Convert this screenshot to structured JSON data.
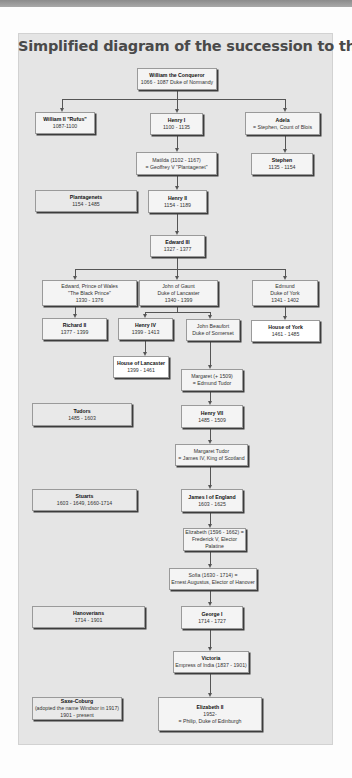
{
  "title": "Simplified diagram of the succession to the Throne",
  "nodes": {
    "william_conqueror": {
      "name": "William the Conqueror",
      "lines": [
        "1066 - 1087 Duke of Normandy"
      ]
    },
    "william_ii": {
      "name": "William II \"Rufus\"",
      "lines": [
        "1087-1100"
      ]
    },
    "henry_i": {
      "name": "Henry I",
      "lines": [
        "1100 - 1135"
      ]
    },
    "adela": {
      "name": "Adela",
      "lines": [
        "= Stephen, Count of Blois"
      ]
    },
    "matilda": {
      "name": "",
      "lines": [
        "Matilda  (1102 - 1167)",
        "= Geoffrey V \"Plantagenet\""
      ]
    },
    "stephen": {
      "name": "Stephen",
      "lines": [
        "1135 - 1154"
      ]
    },
    "plantagenets": {
      "name": "Plantagenets",
      "lines": [
        "1154 - 1485"
      ]
    },
    "henry_ii": {
      "name": "Henry II",
      "lines": [
        "1154 - 1189"
      ]
    },
    "edward_iii": {
      "name": "Edward III",
      "lines": [
        "1327 - 1377"
      ]
    },
    "black_prince": {
      "name": "",
      "lines": [
        "Edward, Prince of Wales",
        "\"The Black Prince\"",
        "1330 - 1376"
      ]
    },
    "john_of_gaunt": {
      "name": "",
      "lines": [
        "John of Gaunt",
        "Duke of Lancaster",
        "1340 - 1399"
      ]
    },
    "edmund": {
      "name": "",
      "lines": [
        "Edmund",
        "Duke of York",
        "1341 - 1402"
      ]
    },
    "richard_ii": {
      "name": "Richard II",
      "lines": [
        "1377 - 1399"
      ]
    },
    "henry_iv": {
      "name": "Henry IV",
      "lines": [
        "1399 - 1413"
      ]
    },
    "john_beaufort": {
      "name": "",
      "lines": [
        "John Beaufort",
        "Duke of Somerset"
      ]
    },
    "house_of_york": {
      "name": "House of York",
      "lines": [
        "1461 - 1485"
      ]
    },
    "house_of_lancaster": {
      "name": "House of Lancaster",
      "lines": [
        "1399 - 1461"
      ]
    },
    "margaret_beaufort": {
      "name": "",
      "lines": [
        "Margaret (+ 1509)",
        "= Edmund Tudor"
      ]
    },
    "tudors": {
      "name": "Tudors",
      "lines": [
        "1485 - 1603"
      ]
    },
    "henry_vii": {
      "name": "Henry VII",
      "lines": [
        "1485 - 1509"
      ]
    },
    "margaret_tudor": {
      "name": "",
      "lines": [
        "Margaret Tudor",
        "= James IV, King of Scotland"
      ]
    },
    "stuarts": {
      "name": "Stuarts",
      "lines": [
        "1603 - 1649, 1660-1714"
      ]
    },
    "james_i": {
      "name": "James I of England",
      "lines": [
        "1603 - 1625"
      ]
    },
    "elizabeth_palatine": {
      "name": "",
      "lines": [
        "Elizabeth (1596 - 1662) =",
        "Frederick V, Elector Palatine"
      ]
    },
    "sofia": {
      "name": "",
      "lines": [
        "Sofia (1630 - 1714) =",
        "Ernest Augustus, Elector of Hanover"
      ]
    },
    "hanoverians": {
      "name": "Hanoverians",
      "lines": [
        "1714 - 1901"
      ]
    },
    "george_i": {
      "name": "George I",
      "lines": [
        "1714 - 1727"
      ]
    },
    "victoria": {
      "name": "Victoria",
      "lines": [
        "Empress of India (1837 - 1901)"
      ]
    },
    "saxe_coburg": {
      "name": "Saxe-Coburg",
      "lines": [
        "(adopted the name Windsor in 1917)",
        "1901 - present"
      ]
    },
    "elizabeth_ii": {
      "name": "Elizabeth II",
      "lines": [
        "1952-",
        "= Philip, Duke of Edinburgh"
      ]
    }
  },
  "colors": {
    "panel": "#e5e5e5",
    "box": "#f4f4f4",
    "line": "#555555",
    "title": "#4a4a4a"
  }
}
